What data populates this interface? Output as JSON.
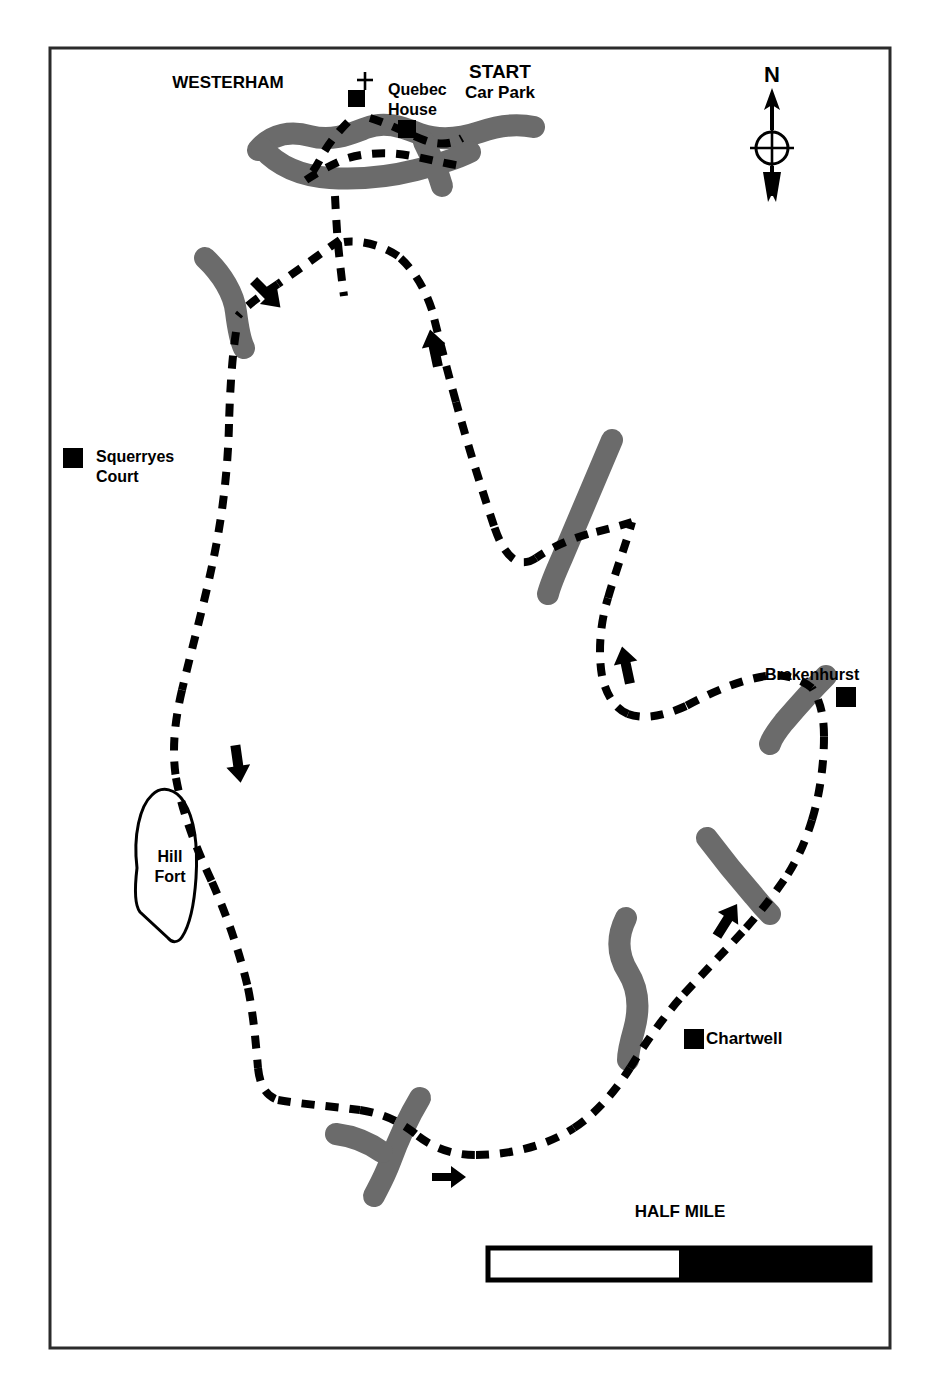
{
  "page": {
    "title": "WALKS ROUND AND ABOUT KENT",
    "background_color": "#ffffff"
  },
  "map": {
    "frame": {
      "x": 50,
      "y": 48,
      "width": 840,
      "height": 1300,
      "border_color": "#2b2b2b",
      "border_width": 3
    },
    "colors": {
      "road": "#6b6b6b",
      "trail": "#000000",
      "marker": "#000000",
      "outline": "#000000",
      "frame": "#2b2b2b"
    },
    "labels": [
      {
        "id": "westerham",
        "text": "WESTERHAM",
        "x": 228,
        "y": 88,
        "size": 17,
        "anchor": "middle"
      },
      {
        "id": "start",
        "text": "START",
        "x": 500,
        "y": 78,
        "size": 19,
        "anchor": "middle"
      },
      {
        "id": "car-park",
        "text": "Car Park",
        "x": 500,
        "y": 98,
        "size": 17,
        "anchor": "middle"
      },
      {
        "id": "quebec",
        "text": "Quebec",
        "x": 388,
        "y": 95,
        "size": 16,
        "anchor": "start"
      },
      {
        "id": "house",
        "text": "House",
        "x": 388,
        "y": 115,
        "size": 16,
        "anchor": "start"
      },
      {
        "id": "squerryes",
        "text": "Squerryes",
        "x": 96,
        "y": 462,
        "size": 16,
        "anchor": "start"
      },
      {
        "id": "court",
        "text": "Court",
        "x": 96,
        "y": 482,
        "size": 16,
        "anchor": "start"
      },
      {
        "id": "brakenhurst",
        "text": "Brakenhurst",
        "x": 765,
        "y": 680,
        "size": 16,
        "anchor": "start"
      },
      {
        "id": "hill",
        "text": "Hill",
        "x": 170,
        "y": 862,
        "size": 16,
        "anchor": "middle"
      },
      {
        "id": "fort",
        "text": "Fort",
        "x": 170,
        "y": 882,
        "size": 16,
        "anchor": "middle"
      },
      {
        "id": "chartwell",
        "text": "Chartwell",
        "x": 706,
        "y": 1044,
        "size": 17,
        "anchor": "start"
      },
      {
        "id": "north",
        "text": "N",
        "x": 772,
        "y": 80,
        "size": 22,
        "anchor": "middle"
      }
    ],
    "point_markers": [
      {
        "id": "quebec-house-marker",
        "x": 357,
        "y": 99,
        "size": 17
      },
      {
        "id": "westerham-village-marker",
        "x": 406,
        "y": 128,
        "size": 17
      },
      {
        "id": "squerryes-court-marker",
        "x": 63,
        "y": 448,
        "size": 20
      },
      {
        "id": "brakenhurst-marker",
        "x": 836,
        "y": 687,
        "size": 20
      },
      {
        "id": "chartwell-marker",
        "x": 684,
        "y": 1029,
        "size": 20
      }
    ],
    "church_symbol": {
      "id": "church-cross",
      "x": 365,
      "y": 82
    },
    "hill_fort_outline": "M 137 868 C 133 835 140 806 152 795 C 162 785 176 789 184 802 C 194 818 198 846 196 878 C 194 908 188 928 182 937 C 178 943 172 943 168 938 L 140 912 C 136 907 134 893 137 868 Z",
    "roads": [
      {
        "id": "westerham-road-main",
        "d": "M 258 150 C 272 133 292 131 310 136 C 332 142 350 134 366 128 C 386 120 404 128 420 134 C 440 141 462 138 480 132 C 500 125 520 124 534 127"
      },
      {
        "id": "westerham-road-south",
        "d": "M 262 148 C 278 166 300 176 330 178 C 360 180 392 176 416 170 C 440 164 458 158 470 152"
      },
      {
        "id": "westerham-road-spur",
        "d": "M 420 140 C 430 156 438 172 442 186"
      },
      {
        "id": "road-nw-bend",
        "d": "M 205 258 C 222 274 234 294 236 312 C 238 328 240 340 244 348"
      },
      {
        "id": "road-ne-diagonal",
        "d": "M 612 440 C 596 478 578 520 562 558 C 554 576 550 586 548 594"
      },
      {
        "id": "road-brakenhurst",
        "d": "M 826 676 C 812 690 796 708 784 722 C 776 732 772 738 770 744"
      },
      {
        "id": "road-east-mid",
        "d": "M 707 838 C 722 858 740 880 754 896 C 762 906 766 910 770 914"
      },
      {
        "id": "road-chartwell",
        "d": "M 626 918 C 616 938 618 956 628 972 C 638 988 640 1008 634 1030 C 630 1044 628 1054 628 1060"
      },
      {
        "id": "road-south-junction-main",
        "d": "M 420 1098 C 408 1118 398 1140 390 1162 C 384 1178 378 1188 374 1196"
      },
      {
        "id": "road-south-junction-spur",
        "d": "M 336 1134 C 352 1136 368 1142 382 1152"
      }
    ],
    "trail": {
      "id": "walking-trail",
      "style": "dashed",
      "dash": "13 11",
      "width": 8,
      "segments": [
        "M 370 118 C 390 124 408 134 424 140 C 440 146 452 144 462 138",
        "M 348 120 C 338 130 330 142 324 152 C 318 164 312 174 306 180",
        "M 306 180 C 318 172 332 164 348 158 C 368 152 392 152 412 156 C 432 160 448 164 462 166",
        "M 335 196 C 336 214 337 230 338 242",
        "M 338 242 C 340 262 342 280 344 294",
        "M 338 240 C 318 254 296 270 276 284",
        "M 276 284 C 258 296 244 306 236 314",
        "M 236 330 C 232 356 230 390 229 424",
        "M 229 424 C 228 470 222 520 212 566",
        "M 212 566 C 204 604 192 648 182 690",
        "M 182 690 C 174 724 172 752 176 778",
        "M 176 778 C 182 812 196 848 212 882",
        "M 212 882 C 228 918 240 954 248 988",
        "M 248 988 C 254 1018 256 1046 258 1068",
        "M 258 1068 C 260 1086 266 1096 278 1100",
        "M 278 1100 C 300 1104 330 1106 360 1110",
        "M 360 1110 C 386 1114 404 1124 418 1136",
        "M 418 1136 C 434 1148 452 1155 476 1155",
        "M 476 1155 C 510 1155 546 1146 574 1128",
        "M 574 1128 C 598 1112 616 1090 630 1068",
        "M 630 1068 C 646 1042 664 1016 684 994",
        "M 684 994 C 706 970 728 948 746 928",
        "M 746 928 C 762 910 776 892 788 874",
        "M 788 874 C 798 858 806 840 812 820",
        "M 812 820 C 820 794 824 764 824 736",
        "M 824 736 C 824 716 820 700 812 688",
        "M 812 688 C 800 678 784 674 766 676",
        "M 766 676 C 740 680 712 692 686 706",
        "M 686 706 C 664 716 644 720 628 714",
        "M 628 714 C 614 708 606 694 602 676",
        "M 602 676 C 598 652 600 624 608 598",
        "M 608 598 C 616 570 626 544 632 522",
        "M 632 522 C 620 526 604 530 588 534",
        "M 588 534 C 568 540 550 548 536 558",
        "M 536 558 C 518 570 504 556 494 526",
        "M 494 526 C 482 490 468 446 456 402",
        "M 456 402 C 446 366 438 334 432 310",
        "M 432 310 C 424 286 412 268 398 256",
        "M 398 256 C 380 244 358 240 344 242"
      ]
    },
    "direction_arrows": [
      {
        "id": "arrow-nw-down-left",
        "x": 267,
        "y": 294,
        "angle": 135
      },
      {
        "id": "arrow-mid-up",
        "x": 434,
        "y": 348,
        "angle": 350
      },
      {
        "id": "arrow-east-up",
        "x": 626,
        "y": 665,
        "angle": 350
      },
      {
        "id": "arrow-west-down",
        "x": 238,
        "y": 764,
        "angle": 170
      },
      {
        "id": "arrow-southeast-up-right",
        "x": 727,
        "y": 920,
        "angle": 30
      },
      {
        "id": "arrow-south-right",
        "x": 449,
        "y": 1177,
        "angle": 90
      }
    ],
    "compass": {
      "id": "compass-rose",
      "cx": 772,
      "cy": 148,
      "label": "N"
    },
    "scale_bar": {
      "id": "scale-bar",
      "label": "HALF MILE",
      "label_x": 680,
      "label_y": 1217,
      "x": 488,
      "y": 1248,
      "width": 382,
      "height": 32,
      "white_fraction": 0.5
    }
  }
}
